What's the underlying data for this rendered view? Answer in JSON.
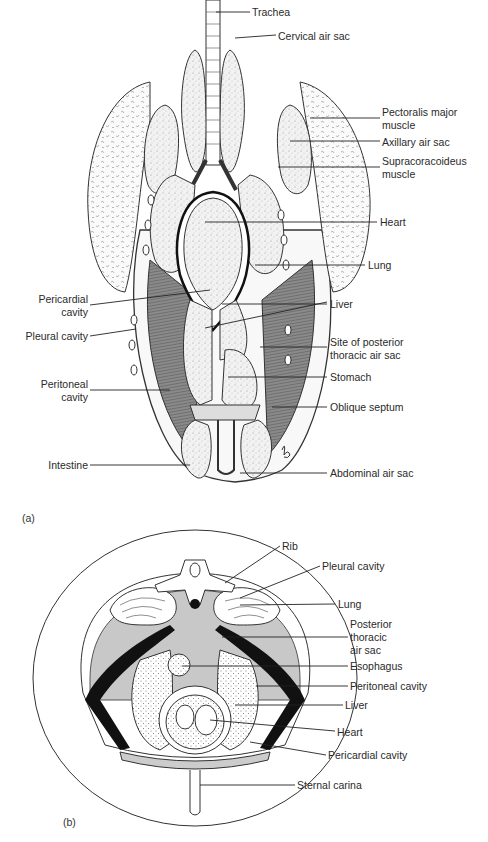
{
  "figure_a": {
    "panel_label": "(a)",
    "labels_right": {
      "trachea": "Trachea",
      "cervical_air_sac": "Cervical air sac",
      "pectoralis_major_1": "Pectoralis major",
      "pectoralis_major_2": "muscle",
      "axillary_air_sac": "Axillary air sac",
      "supracoracoideus_1": "Supracoracoideus",
      "supracoracoideus_2": "muscle",
      "heart": "Heart",
      "lung": "Lung",
      "liver": "Liver",
      "site_posterior_1": "Site of posterior",
      "site_posterior_2": "thoracic air sac",
      "stomach": "Stomach",
      "oblique_septum": "Oblique septum",
      "abdominal_air_sac": "Abdominal air sac"
    },
    "labels_left": {
      "pericardial_1": "Pericardial",
      "pericardial_2": "cavity",
      "pleural_cavity": "Pleural cavity",
      "peritoneal_1": "Peritoneal",
      "peritoneal_2": "cavity",
      "intestine": "Intestine"
    }
  },
  "figure_b": {
    "panel_label": "(b)",
    "labels": {
      "rib": "Rib",
      "pleural_cavity": "Pleural cavity",
      "lung": "Lung",
      "posterior_1": "Posterior",
      "posterior_2": "thoracic",
      "posterior_3": "air sac",
      "esophagus": "Esophagus",
      "peritoneal_cavity": "Peritoneal cavity",
      "liver": "Liver",
      "heart": "Heart",
      "pericardial_cavity": "Pericardial cavity",
      "sternal_carina": "Sternal carina"
    }
  }
}
